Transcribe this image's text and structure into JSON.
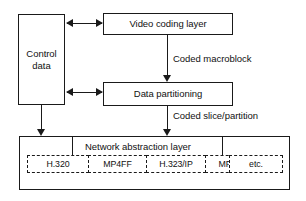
{
  "diagram": {
    "boxes": {
      "control_data": "Control\ndata",
      "video_coding_layer": "Video coding layer",
      "data_partitioning": "Data partitioning",
      "network_abstraction_layer": "Network abstraction layer"
    },
    "edge_labels": {
      "coded_macroblock": "Coded macroblock",
      "coded_slice_partition": "Coded slice/partition"
    },
    "transports": [
      {
        "id": "h320",
        "label": "H.320"
      },
      {
        "id": "mp4ff",
        "label": "MP4FF"
      },
      {
        "id": "h323ip",
        "label": "H.323/IP"
      },
      {
        "id": "mpeg2",
        "label": "MPEG-2"
      },
      {
        "id": "etc",
        "label": "etc."
      }
    ],
    "colors": {
      "stroke": "#1a1a1a",
      "text": "#111111",
      "background": "#ffffff"
    }
  }
}
